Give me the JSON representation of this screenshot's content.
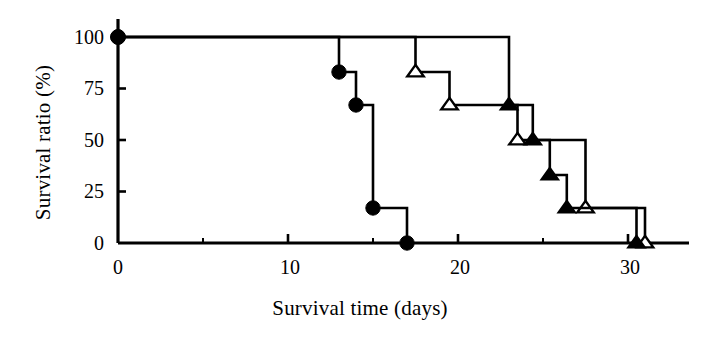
{
  "chart_data": {
    "type": "line",
    "subtype": "kaplan-meier-step",
    "title": "",
    "xlabel": "Survival time (days)",
    "ylabel": "Survival ratio (%)",
    "xlim": [
      0,
      33
    ],
    "ylim": [
      0,
      100
    ],
    "xticks": [
      0,
      10,
      20,
      30
    ],
    "xtick_labels": [
      "0",
      "10",
      "20",
      "30"
    ],
    "yticks": [
      0,
      25,
      50,
      75,
      100
    ],
    "ytick_labels": [
      "0",
      "25",
      "50",
      "75",
      "100"
    ],
    "x_minor_ticks": [
      5,
      15,
      25
    ],
    "grid": false,
    "legend": "none",
    "series": [
      {
        "name": "filled-circle-group",
        "marker": "filled-circle",
        "marker_symbol": "●",
        "color": "#000000",
        "steps": [
          {
            "x": 0,
            "y": 100
          },
          {
            "x": 13,
            "y": 83
          },
          {
            "x": 14,
            "y": 67
          },
          {
            "x": 15,
            "y": 17
          },
          {
            "x": 17,
            "y": 0
          }
        ],
        "marker_points": [
          {
            "x": 0,
            "y": 100
          },
          {
            "x": 13,
            "y": 83
          },
          {
            "x": 14,
            "y": 67
          },
          {
            "x": 15,
            "y": 17
          },
          {
            "x": 17,
            "y": 0
          }
        ]
      },
      {
        "name": "open-triangle-group",
        "marker": "open-triangle",
        "marker_symbol": "△",
        "color": "#000000",
        "steps": [
          {
            "x": 0,
            "y": 100
          },
          {
            "x": 17.5,
            "y": 83
          },
          {
            "x": 19.5,
            "y": 67
          },
          {
            "x": 23.5,
            "y": 50
          },
          {
            "x": 27.5,
            "y": 17
          },
          {
            "x": 31,
            "y": 0
          }
        ],
        "marker_points": [
          {
            "x": 17.5,
            "y": 83
          },
          {
            "x": 19.5,
            "y": 67
          },
          {
            "x": 23.5,
            "y": 50
          },
          {
            "x": 27.5,
            "y": 17
          },
          {
            "x": 31,
            "y": 0
          }
        ]
      },
      {
        "name": "filled-triangle-group",
        "marker": "filled-triangle",
        "marker_symbol": "▲",
        "color": "#000000",
        "steps": [
          {
            "x": 0,
            "y": 100
          },
          {
            "x": 23,
            "y": 67
          },
          {
            "x": 24.4,
            "y": 50
          },
          {
            "x": 25.4,
            "y": 33
          },
          {
            "x": 26.4,
            "y": 17
          },
          {
            "x": 30.5,
            "y": 0
          }
        ],
        "marker_points": [
          {
            "x": 23,
            "y": 67
          },
          {
            "x": 24.4,
            "y": 50
          },
          {
            "x": 25.4,
            "y": 33
          },
          {
            "x": 26.4,
            "y": 17
          },
          {
            "x": 30.5,
            "y": 0
          }
        ]
      }
    ]
  },
  "axes": {
    "x_title": "Survival time (days)",
    "y_title": "Survival ratio (%)",
    "y_labels": [
      "100",
      "75",
      "50",
      "25",
      "0"
    ],
    "x_labels": [
      "0",
      "10",
      "20",
      "30"
    ]
  }
}
